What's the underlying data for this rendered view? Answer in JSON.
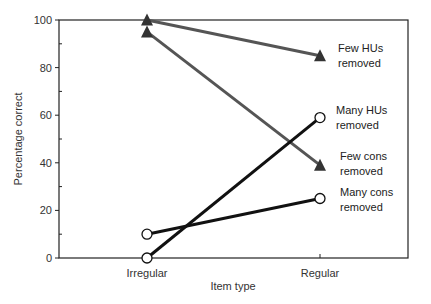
{
  "chart_data": {
    "type": "line",
    "title": "",
    "xlabel": "Item type",
    "ylabel": "Percentage correct",
    "categories": [
      "Irregular",
      "Regular"
    ],
    "ylim": [
      0,
      100
    ],
    "yticks": [
      0,
      20,
      40,
      60,
      80,
      100
    ],
    "grid": false,
    "legend": "inline annotations at right",
    "series": [
      {
        "name": "Few HUs removed",
        "label_lines": [
          "Few HUs",
          "removed"
        ],
        "marker": "triangle",
        "color": "#555555",
        "values": [
          100,
          85
        ]
      },
      {
        "name": "Few cons removed",
        "label_lines": [
          "Few cons",
          "removed"
        ],
        "marker": "triangle",
        "color": "#555555",
        "values": [
          95,
          39
        ]
      },
      {
        "name": "Many HUs removed",
        "label_lines": [
          "Many HUs",
          "removed"
        ],
        "marker": "circle",
        "color": "#111111",
        "values": [
          0,
          59
        ]
      },
      {
        "name": "Many cons removed",
        "label_lines": [
          "Many cons",
          "removed"
        ],
        "marker": "circle",
        "color": "#111111",
        "values": [
          10,
          25
        ]
      }
    ]
  }
}
